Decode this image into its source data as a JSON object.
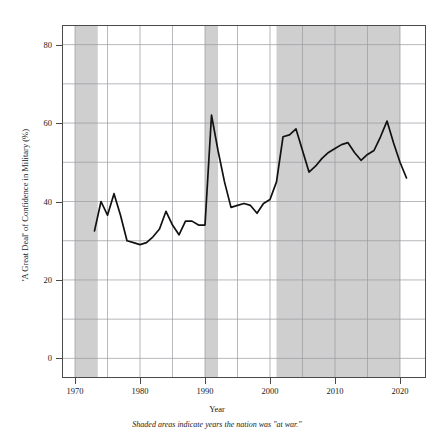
{
  "chart_data": {
    "type": "line",
    "title": "",
    "xlabel": "Year",
    "ylabel": "'A Great Deal' of Confidence in Military (%)",
    "caption": "Shaded areas indicate years the nation was \"at war.\"",
    "xlim": [
      1968,
      2024
    ],
    "ylim": [
      -5,
      85
    ],
    "xticks": [
      1970,
      1980,
      1990,
      2000,
      2010,
      2020
    ],
    "xtick_labels": [
      "1970",
      "1980",
      "1990",
      "2000",
      "2010",
      "2020"
    ],
    "yticks": [
      0,
      20,
      40,
      60,
      80
    ],
    "ytick_labels": [
      "0",
      "20",
      "40",
      "60",
      "80"
    ],
    "grid": true,
    "grid_color": "#9a9aa0",
    "line_color": "#111111",
    "shade_color": "#cfcfcf",
    "legend": "none",
    "x": [
      1973,
      1974,
      1975,
      1976,
      1977,
      1978,
      1979,
      1980,
      1981,
      1982,
      1983,
      1984,
      1985,
      1986,
      1987,
      1988,
      1989,
      1990,
      1991,
      1992,
      1993,
      1994,
      1995,
      1996,
      1997,
      1998,
      1999,
      2000,
      2001,
      2002,
      2003,
      2004,
      2005,
      2006,
      2007,
      2008,
      2009,
      2010,
      2011,
      2012,
      2013,
      2014,
      2015,
      2016,
      2017,
      2018,
      2019,
      2020,
      2021
    ],
    "values": [
      32.5,
      40.0,
      36.5,
      42.0,
      36.5,
      30.0,
      29.5,
      29.0,
      29.5,
      31.0,
      33.0,
      37.5,
      34.0,
      31.5,
      35.0,
      35.0,
      34.0,
      34.0,
      62.0,
      53.0,
      45.0,
      38.5,
      39.0,
      39.5,
      39.0,
      37.0,
      39.5,
      40.5,
      45.0,
      56.5,
      57.0,
      58.5,
      53.0,
      47.5,
      49.0,
      51.0,
      52.5,
      53.5,
      54.5,
      55.0,
      52.5,
      50.5,
      52.0,
      53.0,
      56.5,
      60.5,
      55.0,
      50.0,
      46.0
    ],
    "shaded_bands": [
      {
        "label": "Vietnam War",
        "start": 1970.0,
        "end": 1973.5
      },
      {
        "label": "Gulf War",
        "start": 1990.0,
        "end": 1992.0
      },
      {
        "label": "War on Terror",
        "start": 2001.0,
        "end": 2020.0
      }
    ]
  }
}
